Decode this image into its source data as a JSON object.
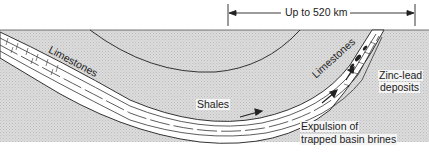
{
  "diagram": {
    "measurement": {
      "label": "Up to 520 km"
    },
    "labels": {
      "limestones_left": "Limestones",
      "limestones_right": "Limestones",
      "shales": "Shales",
      "deposits_line1": "Zinc-lead",
      "deposits_line2": "deposits",
      "expulsion_line1": "Expulsion of",
      "expulsion_line2": "trapped basin brines"
    },
    "colors": {
      "background": "#ffffff",
      "rock_fill": "#d9d9d9",
      "layer_fill": "#ffffff",
      "line": "#333333"
    }
  }
}
